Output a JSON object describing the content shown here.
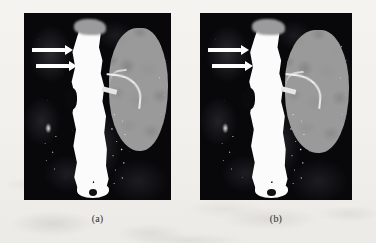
{
  "figure": {
    "background_color": "#f2f1ee",
    "panel_count": 2
  },
  "panels": [
    {
      "id": "panel-a",
      "caption": "(a)",
      "modality": "CT angiography maximum intensity projection",
      "anatomy": {
        "aorta_label": "aorta",
        "kidney_label": "kidney",
        "renal_artery_label": "renal artery"
      },
      "annotations": {
        "arrow_count": 2,
        "arrow_color": "#ffffff",
        "arrow_direction": "right"
      },
      "colors": {
        "scan_background": "#08080b",
        "vessel_bright": "#fbfbfb",
        "kidney_grey": "#9a9a9a"
      }
    },
    {
      "id": "panel-b",
      "caption": "(b)",
      "modality": "CT angiography maximum intensity projection",
      "anatomy": {
        "aorta_label": "aorta",
        "kidney_label": "kidney",
        "renal_artery_label": "renal artery"
      },
      "annotations": {
        "arrow_count": 2,
        "arrow_color": "#ffffff",
        "arrow_direction": "right"
      },
      "colors": {
        "scan_background": "#08080b",
        "vessel_bright": "#fbfbfb",
        "kidney_grey": "#9a9a9a"
      }
    }
  ]
}
